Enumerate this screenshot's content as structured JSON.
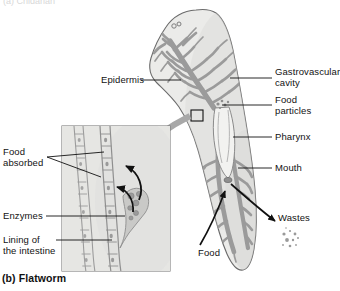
{
  "figure": {
    "caption": "(b) Flatworm",
    "partial_top_text": "(a) Cnidarian"
  },
  "labels": {
    "epidermis": "Epidermis",
    "gastrovascular_cavity": "Gastrovascular\ncavity",
    "gastrovascular_cavity_line1": "Gastrovascular",
    "gastrovascular_cavity_line2": "cavity",
    "food_particles_line1": "Food",
    "food_particles_line2": "particles",
    "pharynx": "Pharynx",
    "mouth": "Mouth",
    "wastes": "Wastes",
    "food": "Food",
    "food_absorbed_line1": "Food",
    "food_absorbed_line2": "absorbed",
    "enzymes": "Enzymes",
    "lining_line1": "Lining of",
    "lining_line2": "the intestine"
  },
  "colors": {
    "body_fill": "#e8e8e6",
    "body_outline": "#6f6f6f",
    "cavity_gray": "#9a9a9a",
    "inset_fill": "#e2e2e0",
    "inset_border": "#7b7b7b",
    "callout_arrow": "#a6a6a6",
    "leader_line": "#1a1a1a",
    "text": "#121212"
  },
  "inset": {
    "name": "intestinal-lining-detail",
    "box": {
      "x": 62,
      "y": 126,
      "width": 108,
      "height": 145
    }
  }
}
